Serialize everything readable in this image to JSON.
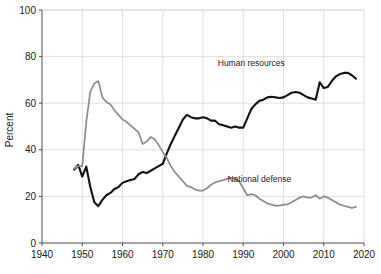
{
  "chart_data": {
    "type": "line",
    "title": "",
    "xlabel": "",
    "ylabel": "Percent",
    "xlim": [
      1940,
      2020
    ],
    "ylim": [
      0,
      100
    ],
    "grid": true,
    "legend_position": "inline-annotation",
    "xticks": [
      "1940",
      "1950",
      "1960",
      "1970",
      "1980",
      "1990",
      "2000",
      "2010",
      "2020"
    ],
    "yticks": [
      "0",
      "20",
      "40",
      "60",
      "80",
      "100"
    ],
    "xtick_values": [
      1940,
      1950,
      1960,
      1970,
      1980,
      1990,
      2000,
      2010,
      2020
    ],
    "ytick_values": [
      0,
      20,
      40,
      60,
      80,
      100
    ],
    "series": [
      {
        "name": "Human resources",
        "color": "#111111",
        "width": 2.1,
        "label_x": 1992,
        "label_y": 76,
        "x": [
          1948,
          1949,
          1950,
          1951,
          1952,
          1953,
          1954,
          1955,
          1956,
          1957,
          1958,
          1959,
          1960,
          1961,
          1962,
          1963,
          1964,
          1965,
          1966,
          1967,
          1968,
          1969,
          1970,
          1971,
          1972,
          1973,
          1974,
          1975,
          1976,
          1977,
          1978,
          1979,
          1980,
          1981,
          1982,
          1983,
          1984,
          1985,
          1986,
          1987,
          1988,
          1989,
          1990,
          1991,
          1992,
          1993,
          1994,
          1995,
          1996,
          1997,
          1998,
          1999,
          2000,
          2001,
          2002,
          2003,
          2004,
          2005,
          2006,
          2007,
          2008,
          2009,
          2010,
          2011,
          2012,
          2013,
          2014,
          2015,
          2016,
          2017,
          2018
        ],
        "y": [
          31.5,
          33.5,
          28.5,
          32.8,
          24.0,
          17.5,
          15.8,
          18.5,
          20.5,
          21.5,
          23.2,
          24.0,
          25.8,
          26.5,
          27.0,
          27.5,
          29.5,
          30.5,
          30.0,
          31.0,
          32.0,
          33.0,
          34.0,
          38.5,
          42.5,
          46.0,
          49.5,
          53.0,
          55.0,
          54.0,
          53.5,
          53.5,
          54.0,
          53.5,
          52.5,
          52.5,
          51.0,
          50.5,
          50.0,
          49.5,
          50.0,
          49.5,
          49.5,
          53.5,
          57.5,
          59.5,
          61.0,
          61.5,
          62.5,
          62.8,
          62.5,
          62.2,
          62.5,
          63.5,
          64.5,
          64.8,
          64.5,
          63.5,
          62.5,
          62.0,
          61.5,
          69.0,
          66.5,
          67.0,
          69.5,
          71.5,
          72.5,
          73.0,
          73.0,
          72.0,
          70.5
        ]
      },
      {
        "name": "National defense",
        "color": "#8c8c8c",
        "width": 1.7,
        "label_x": 1994,
        "label_y": 26,
        "x": [
          1948,
          1949,
          1950,
          1951,
          1952,
          1953,
          1954,
          1955,
          1956,
          1957,
          1958,
          1959,
          1960,
          1961,
          1962,
          1963,
          1964,
          1965,
          1966,
          1967,
          1968,
          1969,
          1970,
          1971,
          1972,
          1973,
          1974,
          1975,
          1976,
          1977,
          1978,
          1979,
          1980,
          1981,
          1982,
          1983,
          1984,
          1985,
          1986,
          1987,
          1988,
          1989,
          1990,
          1991,
          1992,
          1993,
          1994,
          1995,
          1996,
          1997,
          1998,
          1999,
          2000,
          2001,
          2002,
          2003,
          2004,
          2005,
          2006,
          2007,
          2008,
          2009,
          2010,
          2011,
          2012,
          2013,
          2014,
          2015,
          2016,
          2017,
          2018
        ],
        "y": [
          32.0,
          33.0,
          33.0,
          52.0,
          65.0,
          68.5,
          69.5,
          62.5,
          60.5,
          59.5,
          57.0,
          55.0,
          53.0,
          52.0,
          50.5,
          49.0,
          47.5,
          42.5,
          43.5,
          45.5,
          44.5,
          42.0,
          39.0,
          36.5,
          33.0,
          30.5,
          28.5,
          26.5,
          24.5,
          24.0,
          23.0,
          22.5,
          22.5,
          23.5,
          25.0,
          26.0,
          26.5,
          27.0,
          27.5,
          28.0,
          27.5,
          26.5,
          23.5,
          20.5,
          21.0,
          20.5,
          19.0,
          18.0,
          17.0,
          16.5,
          16.0,
          16.0,
          16.5,
          16.5,
          17.5,
          18.5,
          19.5,
          20.0,
          19.5,
          19.5,
          20.5,
          19.0,
          20.0,
          19.5,
          18.5,
          17.5,
          16.5,
          16.0,
          15.5,
          15.0,
          15.5
        ]
      }
    ]
  },
  "axes": {
    "y_title": "Percent"
  }
}
